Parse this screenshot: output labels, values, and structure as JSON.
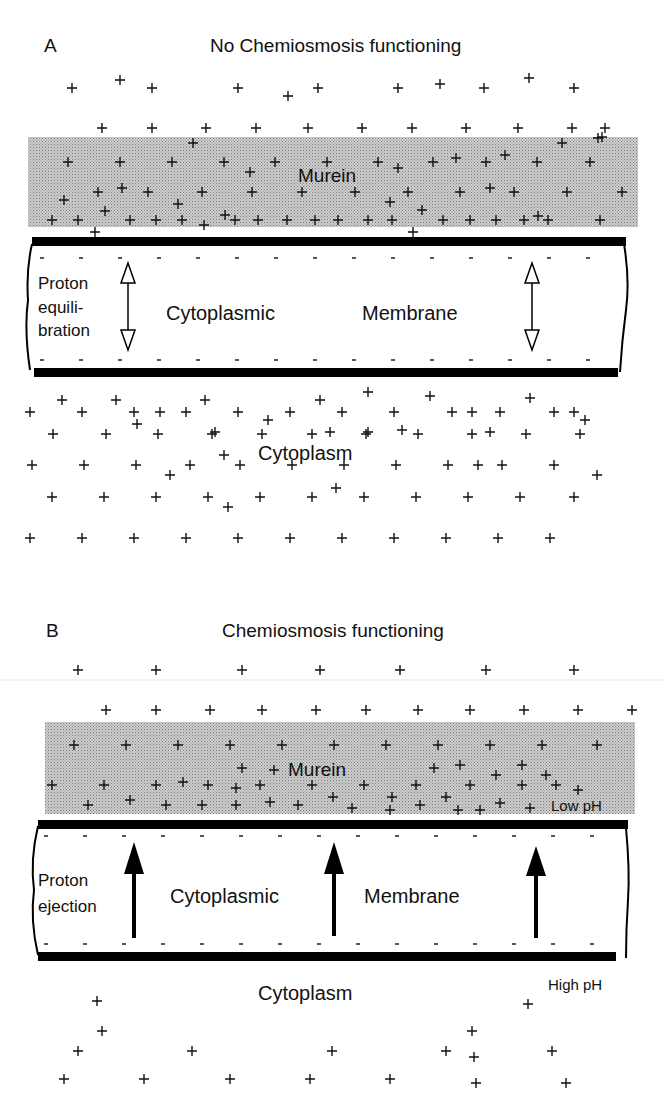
{
  "panelA": {
    "letter": "A",
    "title": "No Chemiosmosis functioning",
    "murein_label": "Murein",
    "membrane_label_left": "Cytoplasmic",
    "membrane_label_right": "Membrane",
    "side_label": [
      "Proton",
      "equili-",
      "bration"
    ],
    "cytoplasm_label": "Cytoplasm",
    "arrow_type": "double-headed-hollow",
    "plus_outside": [
      [
        72,
        88
      ],
      [
        120,
        80
      ],
      [
        152,
        88
      ],
      [
        238,
        88
      ],
      [
        288,
        96
      ],
      [
        318,
        88
      ],
      [
        398,
        88
      ],
      [
        440,
        84
      ],
      [
        484,
        88
      ],
      [
        529,
        78
      ],
      [
        574,
        88
      ],
      [
        102,
        128
      ],
      [
        152,
        128
      ],
      [
        206,
        128
      ],
      [
        256,
        128
      ],
      [
        308,
        128
      ],
      [
        362,
        128
      ],
      [
        412,
        128
      ],
      [
        466,
        128
      ],
      [
        518,
        128
      ],
      [
        572,
        128
      ],
      [
        605,
        128
      ],
      [
        598,
        138
      ]
    ],
    "plus_murein": [
      [
        193,
        143
      ],
      [
        562,
        143
      ],
      [
        602,
        137
      ],
      [
        68,
        162
      ],
      [
        120,
        162
      ],
      [
        172,
        162
      ],
      [
        224,
        162
      ],
      [
        250,
        172
      ],
      [
        275,
        162
      ],
      [
        327,
        162
      ],
      [
        378,
        162
      ],
      [
        398,
        168
      ],
      [
        433,
        162
      ],
      [
        456,
        158
      ],
      [
        486,
        162
      ],
      [
        505,
        155
      ],
      [
        537,
        162
      ],
      [
        590,
        162
      ],
      [
        64,
        200
      ],
      [
        98,
        192
      ],
      [
        122,
        188
      ],
      [
        148,
        192
      ],
      [
        178,
        204
      ],
      [
        202,
        192
      ],
      [
        252,
        192
      ],
      [
        302,
        192
      ],
      [
        355,
        192
      ],
      [
        390,
        202
      ],
      [
        408,
        192
      ],
      [
        460,
        192
      ],
      [
        490,
        188
      ],
      [
        514,
        192
      ],
      [
        538,
        216
      ],
      [
        567,
        192
      ],
      [
        622,
        192
      ],
      [
        52,
        220
      ],
      [
        78,
        220
      ],
      [
        105,
        211
      ],
      [
        130,
        220
      ],
      [
        156,
        220
      ],
      [
        182,
        220
      ],
      [
        204,
        225
      ],
      [
        225,
        215
      ],
      [
        235,
        220
      ],
      [
        258,
        220
      ],
      [
        287,
        220
      ],
      [
        315,
        220
      ],
      [
        338,
        220
      ],
      [
        368,
        220
      ],
      [
        392,
        220
      ],
      [
        413,
        232
      ],
      [
        422,
        210
      ],
      [
        443,
        220
      ],
      [
        470,
        220
      ],
      [
        496,
        220
      ],
      [
        524,
        220
      ],
      [
        548,
        220
      ],
      [
        600,
        220
      ],
      [
        95,
        232
      ]
    ],
    "plus_cytoplasm": [
      [
        30,
        412
      ],
      [
        62,
        400
      ],
      [
        82,
        412
      ],
      [
        116,
        400
      ],
      [
        134,
        412
      ],
      [
        160,
        412
      ],
      [
        186,
        412
      ],
      [
        205,
        400
      ],
      [
        238,
        412
      ],
      [
        268,
        420
      ],
      [
        290,
        412
      ],
      [
        320,
        400
      ],
      [
        342,
        412
      ],
      [
        368,
        392
      ],
      [
        394,
        412
      ],
      [
        430,
        396
      ],
      [
        452,
        412
      ],
      [
        472,
        412
      ],
      [
        500,
        412
      ],
      [
        530,
        398
      ],
      [
        554,
        412
      ],
      [
        574,
        412
      ],
      [
        585,
        420
      ],
      [
        215,
        432
      ],
      [
        330,
        432
      ],
      [
        368,
        432
      ],
      [
        490,
        432
      ],
      [
        53,
        434
      ],
      [
        106,
        434
      ],
      [
        137,
        424
      ],
      [
        158,
        434
      ],
      [
        212,
        434
      ],
      [
        262,
        434
      ],
      [
        312,
        434
      ],
      [
        366,
        434
      ],
      [
        402,
        430
      ],
      [
        418,
        434
      ],
      [
        472,
        434
      ],
      [
        526,
        434
      ],
      [
        580,
        434
      ],
      [
        32,
        465
      ],
      [
        84,
        465
      ],
      [
        136,
        465
      ],
      [
        170,
        475
      ],
      [
        190,
        465
      ],
      [
        224,
        455
      ],
      [
        240,
        465
      ],
      [
        292,
        465
      ],
      [
        344,
        465
      ],
      [
        396,
        465
      ],
      [
        448,
        465
      ],
      [
        478,
        465
      ],
      [
        502,
        465
      ],
      [
        554,
        465
      ],
      [
        597,
        475
      ],
      [
        52,
        497
      ],
      [
        104,
        497
      ],
      [
        156,
        497
      ],
      [
        208,
        497
      ],
      [
        228,
        507
      ],
      [
        260,
        497
      ],
      [
        312,
        497
      ],
      [
        336,
        488
      ],
      [
        364,
        497
      ],
      [
        416,
        497
      ],
      [
        468,
        497
      ],
      [
        520,
        497
      ],
      [
        574,
        497
      ],
      [
        30,
        538
      ],
      [
        82,
        538
      ],
      [
        134,
        538
      ],
      [
        186,
        538
      ],
      [
        238,
        538
      ],
      [
        290,
        538
      ],
      [
        342,
        538
      ],
      [
        394,
        538
      ],
      [
        446,
        538
      ],
      [
        498,
        538
      ],
      [
        550,
        538
      ]
    ]
  },
  "panelB": {
    "letter": "B",
    "title": "Chemiosmosis functioning",
    "murein_label": "Murein",
    "membrane_label_left": "Cytoplasmic",
    "membrane_label_right": "Membrane",
    "side_label": [
      "Proton",
      "ejection"
    ],
    "cytoplasm_label": "Cytoplasm",
    "low_ph_label": "Low pH",
    "high_ph_label": "High pH",
    "arrow_type": "single-up-solid",
    "plus_outside": [
      [
        78,
        670
      ],
      [
        156,
        670
      ],
      [
        242,
        670
      ],
      [
        320,
        670
      ],
      [
        400,
        670
      ],
      [
        486,
        670
      ],
      [
        574,
        670
      ],
      [
        106,
        710
      ],
      [
        156,
        710
      ],
      [
        210,
        710
      ],
      [
        262,
        710
      ],
      [
        316,
        710
      ],
      [
        366,
        710
      ],
      [
        418,
        710
      ],
      [
        470,
        710
      ],
      [
        524,
        710
      ],
      [
        578,
        710
      ],
      [
        632,
        710
      ]
    ],
    "plus_murein": [
      [
        74,
        745
      ],
      [
        126,
        745
      ],
      [
        178,
        745
      ],
      [
        230,
        745
      ],
      [
        282,
        745
      ],
      [
        334,
        745
      ],
      [
        386,
        745
      ],
      [
        438,
        745
      ],
      [
        490,
        745
      ],
      [
        542,
        745
      ],
      [
        597,
        745
      ],
      [
        242,
        768
      ],
      [
        274,
        770
      ],
      [
        434,
        768
      ],
      [
        460,
        765
      ],
      [
        496,
        775
      ],
      [
        522,
        765
      ],
      [
        546,
        775
      ],
      [
        52,
        785
      ],
      [
        104,
        785
      ],
      [
        156,
        785
      ],
      [
        183,
        782
      ],
      [
        208,
        785
      ],
      [
        236,
        788
      ],
      [
        260,
        785
      ],
      [
        312,
        785
      ],
      [
        333,
        797
      ],
      [
        364,
        785
      ],
      [
        392,
        797
      ],
      [
        416,
        785
      ],
      [
        446,
        797
      ],
      [
        470,
        785
      ],
      [
        522,
        785
      ],
      [
        556,
        785
      ],
      [
        578,
        790
      ],
      [
        88,
        805
      ],
      [
        130,
        800
      ],
      [
        166,
        805
      ],
      [
        202,
        805
      ],
      [
        236,
        805
      ],
      [
        270,
        802
      ],
      [
        298,
        805
      ],
      [
        352,
        808
      ],
      [
        390,
        810
      ],
      [
        420,
        805
      ],
      [
        458,
        810
      ],
      [
        480,
        810
      ],
      [
        500,
        803
      ],
      [
        530,
        808
      ]
    ],
    "plus_cytoplasm": [
      [
        97,
        1001
      ],
      [
        528,
        1004
      ],
      [
        102,
        1031
      ],
      [
        472,
        1031
      ],
      [
        78,
        1051
      ],
      [
        192,
        1051
      ],
      [
        332,
        1051
      ],
      [
        446,
        1051
      ],
      [
        474,
        1057
      ],
      [
        552,
        1051
      ],
      [
        64,
        1079
      ],
      [
        144,
        1079
      ],
      [
        230,
        1079
      ],
      [
        310,
        1079
      ],
      [
        390,
        1079
      ],
      [
        476,
        1083
      ],
      [
        566,
        1083
      ]
    ]
  }
}
